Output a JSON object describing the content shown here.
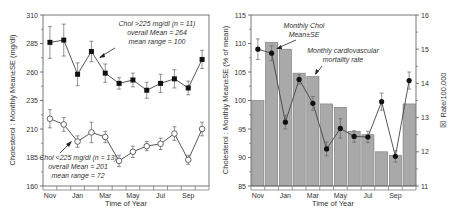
{
  "chart_data": [
    {
      "type": "line",
      "title": "",
      "xlabel": "Time of Year",
      "ylabel": "Cholesterol : Monthly Mean±SE (mg/dl)",
      "ylim": [
        160,
        310
      ],
      "yticks": [
        160,
        185,
        210,
        235,
        260,
        285,
        310
      ],
      "categories": [
        "Nov",
        "Dec",
        "Jan",
        "Feb",
        "Mar",
        "Apr",
        "May",
        "Jun",
        "Jul",
        "Aug",
        "Sep",
        "Oct"
      ],
      "xtick_labels": [
        "Nov",
        "Jan",
        "Mar",
        "May",
        "Jul",
        "Sep"
      ],
      "grid": false,
      "series": [
        {
          "name": "Chol >225 mg/dl (n = 11)",
          "marker": "filled-square",
          "values": [
            286,
            288,
            258,
            278,
            259,
            250,
            253,
            244,
            250,
            254,
            246,
            271
          ],
          "se": [
            14,
            14,
            10,
            9,
            8,
            5,
            6,
            7,
            8,
            8,
            6,
            8
          ]
        },
        {
          "name": "Chol <225 mg/dl (n = 13)",
          "marker": "open-circle",
          "values": [
            219,
            214,
            199,
            207,
            203,
            182,
            190,
            195,
            197,
            206,
            183,
            210
          ],
          "se": [
            8,
            6,
            5,
            9,
            5,
            5,
            5,
            4,
            5,
            6,
            4,
            6
          ]
        }
      ],
      "annotations": [
        {
          "lines": [
            "Chol >225 mg/dl (n = 11)",
            "overall Mean = 264",
            "mean range = 100"
          ]
        },
        {
          "lines": [
            "Chol <225 mg/dl (n = 13)",
            "overall Mean = 201",
            "mean range = 72"
          ]
        }
      ]
    },
    {
      "type": "bar",
      "title": "",
      "xlabel": "Time of Year",
      "ylabel": "Cholesterol : Monthly Mean±SE (% of mean)",
      "y2label": "Rate/100,000",
      "ylim": [
        85,
        115
      ],
      "yticks": [
        85,
        90,
        95,
        100,
        105,
        110,
        115
      ],
      "y2lim": [
        11,
        16
      ],
      "y2ticks": [
        11,
        12,
        13,
        14,
        15,
        16
      ],
      "categories": [
        "Nov",
        "Dec",
        "Jan",
        "Feb",
        "Mar",
        "Apr",
        "May",
        "Jun",
        "Jul",
        "Aug",
        "Sep",
        "Oct"
      ],
      "xtick_labels": [
        "Nov",
        "Jan",
        "Mar",
        "May",
        "Jul",
        "Sep"
      ],
      "grid": false,
      "series": [
        {
          "name": "Monthly cardiovascular mortality rate",
          "type": "bar",
          "axis": "right",
          "values": [
            13.5,
            15.2,
            15.0,
            14.3,
            14.2,
            13.4,
            13.3,
            12.6,
            12.5,
            12.0,
            11.9,
            13.4
          ]
        },
        {
          "name": "Monthly Chol Mean±SE",
          "type": "line",
          "axis": "left",
          "values": [
            109,
            108.3,
            96.2,
            103.7,
            99.5,
            91.5,
            95.1,
            93.7,
            93.6,
            99.8,
            90.2,
            103.5
          ],
          "se": [
            1.8,
            1.3,
            1.2,
            0.8,
            1.2,
            1.2,
            1.7,
            1.0,
            1.0,
            1.5,
            1.0,
            1.5
          ]
        }
      ],
      "annotations": [
        {
          "lines": [
            "Monthly Chol",
            "Mean±SE"
          ]
        },
        {
          "lines": [
            "Monthly cardiovascular",
            "mortality rate"
          ]
        }
      ]
    }
  ],
  "left_chart": {
    "ylabel": "Cholesterol : Monthly Mean±SE (mg/dl)",
    "xlabel": "Time of Year",
    "yticks": [
      "310",
      "285",
      "260",
      "235",
      "210",
      "185",
      "160"
    ],
    "xticks": [
      "Nov",
      "Jan",
      "Mar",
      "May",
      "Jul",
      "Sep"
    ],
    "ann_high": [
      "Chol >225 mg/dl (n = 11)",
      "overall Mean = 264",
      "mean range = 100"
    ],
    "ann_low": [
      "Chol <225 mg/dl (n = 13)",
      "overall Mean = 201",
      "mean range = 72"
    ]
  },
  "right_chart": {
    "ylabel": "Cholesterol : Monthly Mean±SE (% of mean)",
    "y2label": "Rate/100,000",
    "y2symbol": "☒",
    "xlabel": "Time of Year",
    "yticks": [
      "115",
      "110",
      "105",
      "100",
      "95",
      "90",
      "85"
    ],
    "y2ticks": [
      "16",
      "15",
      "14",
      "13",
      "12",
      "11"
    ],
    "xticks": [
      "Nov",
      "Jan",
      "Mar",
      "May",
      "Jul",
      "Sep"
    ],
    "ann_chol": [
      "Monthly Chol",
      "Mean±SE"
    ],
    "ann_mort": [
      "Monthly cardiovascular",
      "mortality rate"
    ]
  },
  "colors": {
    "axis": "#555555",
    "bar_fill": "#a9a9a9",
    "bar_stroke": "#777777",
    "line": "#444444",
    "marker": "#111111"
  }
}
